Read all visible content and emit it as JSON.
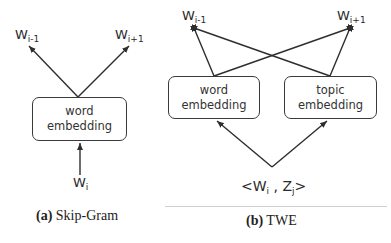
{
  "panel_a": {
    "outputs": [
      {
        "base": "W",
        "sub": "i-1"
      },
      {
        "base": "W",
        "sub": "i+1"
      }
    ],
    "box": {
      "line1": "word",
      "line2": "embedding"
    },
    "input": {
      "base": "W",
      "sub": "i"
    },
    "caption": {
      "tag": "(a)",
      "text": " Skip-Gram"
    }
  },
  "panel_b": {
    "outputs": [
      {
        "base": "W",
        "sub": "i-1"
      },
      {
        "base": "W",
        "sub": "i+1"
      }
    ],
    "boxes": [
      {
        "line1": "word",
        "line2": "embedding"
      },
      {
        "line1": "topic",
        "line2": "embedding"
      }
    ],
    "input": {
      "open": "<",
      "w": "W",
      "w_sub": "i",
      "sep": " , ",
      "z": "Z",
      "z_sub": "j",
      "close": ">"
    },
    "caption": {
      "tag": "(b)",
      "text": " TWE"
    }
  },
  "colors": {
    "stroke": "#2e2e2e",
    "text": "#2a2a2a",
    "rule": "#cfcfcf"
  }
}
